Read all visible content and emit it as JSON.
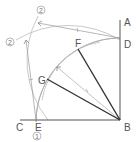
{
  "diagram": {
    "points": {
      "A": {
        "label": "A"
      },
      "B": {
        "label": "B"
      },
      "C": {
        "label": "C"
      },
      "D": {
        "label": "D"
      },
      "E": {
        "label": "E"
      },
      "F": {
        "label": "F"
      },
      "G": {
        "label": "G"
      }
    },
    "step_markers": {
      "step1": "1",
      "step2_top": "2",
      "step2_left": "2"
    },
    "colors": {
      "main_line": "#555555",
      "construction": "#aaaaaa",
      "bold_line": "#333333"
    }
  }
}
